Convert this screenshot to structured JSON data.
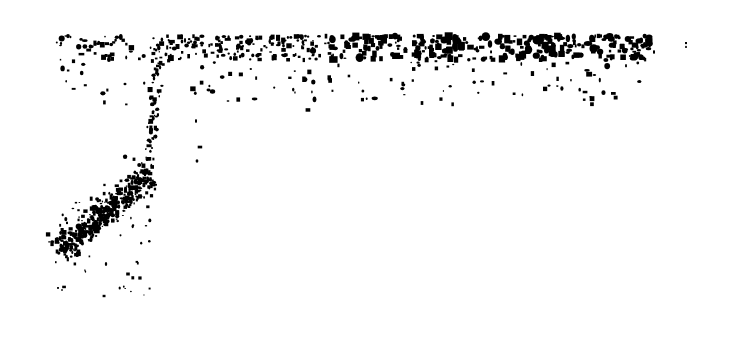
{
  "chart_data": {
    "type": "scatter",
    "title": "",
    "xlabel": "",
    "ylabel": "",
    "axes_visible": false,
    "grid": false,
    "legend": null,
    "marker_color": "#000000",
    "background": "#ffffff",
    "coordinate_space": "pixel",
    "xlim": [
      0,
      732
    ],
    "ylim": [
      348,
      0
    ],
    "regions": [
      {
        "name": "top-band",
        "description": "dense horizontal band of points",
        "x_range": [
          55,
          650
        ],
        "y_range": [
          36,
          60
        ],
        "density": "high",
        "count": 520,
        "seed": 11
      },
      {
        "name": "top-band-tail",
        "description": "sparse points trailing below the top band",
        "x_range": [
          60,
          640
        ],
        "y_range": [
          55,
          105
        ],
        "density": "low",
        "count": 150,
        "seed": 23
      },
      {
        "name": "vertical-stem",
        "description": "near-vertical line of points linking the lower cluster to the top band",
        "x_start": 160,
        "x_end": 146,
        "y_range": [
          40,
          182
        ],
        "jitter": 2.5,
        "count": 75,
        "seed": 37
      },
      {
        "name": "lower-diagonal-cluster",
        "description": "dense diagonal cluster rising from lower-left toward the stem",
        "from": [
          57,
          252
        ],
        "to": [
          150,
          176
        ],
        "spread": 15,
        "count": 420,
        "seed": 41
      },
      {
        "name": "lower-outliers",
        "description": "scattered outliers below/right of the diagonal cluster",
        "x_range": [
          55,
          150
        ],
        "y_range": [
          200,
          298
        ],
        "count": 45,
        "seed": 53
      }
    ],
    "explicit_points": [
      [
        686,
        43
      ],
      [
        686,
        47
      ],
      [
        200,
        147
      ],
      [
        196,
        121
      ],
      [
        197,
        161
      ],
      [
        104,
        296
      ],
      [
        58,
        288
      ],
      [
        62,
        290
      ],
      [
        64,
        287
      ],
      [
        106,
        264
      ],
      [
        140,
        278
      ],
      [
        128,
        274
      ],
      [
        125,
        84
      ],
      [
        308,
        110
      ],
      [
        228,
        101
      ],
      [
        422,
        103
      ],
      [
        585,
        92
      ],
      [
        654,
        52
      ]
    ]
  }
}
